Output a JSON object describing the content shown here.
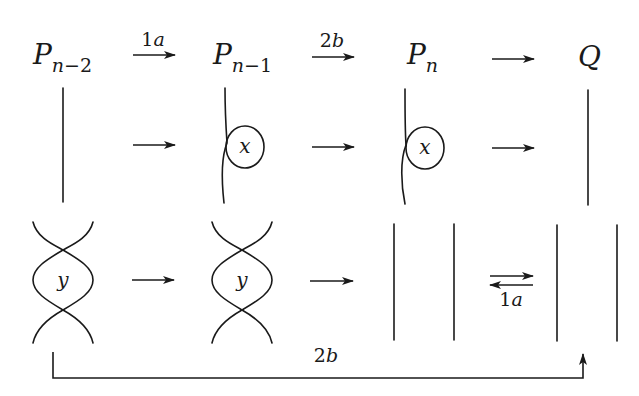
{
  "diagram": {
    "nodes": [
      {
        "main": "P",
        "sub_var": "n",
        "sub_rest": "−2"
      },
      {
        "main": "P",
        "sub_var": "n",
        "sub_rest": "−1"
      },
      {
        "main": "P",
        "sub_var": "n",
        "sub_rest": ""
      },
      {
        "main": "Q",
        "sub_var": "",
        "sub_rest": ""
      }
    ],
    "top_arrows": [
      {
        "num": "1",
        "letter": "a"
      },
      {
        "num": "2",
        "letter": "b"
      },
      {
        "num": "",
        "letter": ""
      }
    ],
    "loop_labels": [
      "x",
      "x"
    ],
    "lens_labels": [
      "y",
      "y"
    ],
    "equivalence_arrow": {
      "num": "1",
      "letter": "a"
    },
    "bottom_arrow": {
      "num": "2",
      "letter": "b"
    },
    "colors": {
      "ink": "#1a1a1a",
      "background": "#ffffff"
    }
  }
}
